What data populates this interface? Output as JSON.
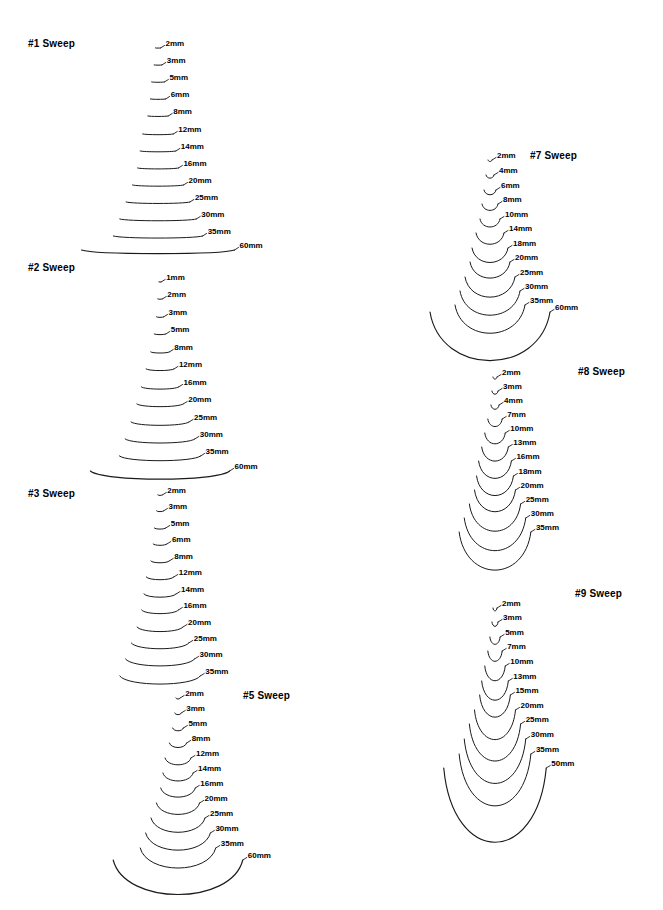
{
  "page": {
    "background": "#ffffff",
    "ink": "#1a1a1a",
    "width": 663,
    "height": 910
  },
  "chart_data": {
    "type": "line",
    "xlabel": "",
    "ylabel": "",
    "grid": false,
    "legend": "none",
    "series": [
      {
        "name": "#1 Sweep",
        "curvature": 0.02,
        "values": [
          2,
          3,
          5,
          6,
          8,
          12,
          14,
          16,
          20,
          25,
          30,
          35,
          60
        ],
        "labels": [
          "2mm",
          "3mm",
          "5mm",
          "6mm",
          "8mm",
          "12mm",
          "14mm",
          "16mm",
          "20mm",
          "25mm",
          "30mm",
          "35mm",
          "60mm"
        ]
      },
      {
        "name": "#2 Sweep",
        "curvature": 0.05,
        "values": [
          1,
          2,
          3,
          5,
          8,
          12,
          16,
          20,
          25,
          30,
          35,
          60
        ],
        "labels": [
          "1mm",
          "2mm",
          "3mm",
          "5mm",
          "8mm",
          "12mm",
          "16mm",
          "20mm",
          "25mm",
          "30mm",
          "35mm",
          "60mm"
        ]
      },
      {
        "name": "#3 Sweep",
        "curvature": 0.09,
        "values": [
          2,
          3,
          5,
          6,
          8,
          12,
          14,
          16,
          20,
          25,
          30,
          35
        ],
        "labels": [
          "2mm",
          "3mm",
          "5mm",
          "6mm",
          "8mm",
          "12mm",
          "14mm",
          "16mm",
          "20mm",
          "25mm",
          "30mm",
          "35mm"
        ]
      },
      {
        "name": "#5 Sweep",
        "curvature": 0.24,
        "values": [
          2,
          3,
          5,
          8,
          12,
          14,
          16,
          20,
          25,
          30,
          35,
          60
        ],
        "labels": [
          "2mm",
          "3mm",
          "5mm",
          "8mm",
          "12mm",
          "14mm",
          "16mm",
          "20mm",
          "25mm",
          "30mm",
          "35mm",
          "60mm"
        ]
      },
      {
        "name": "#7 Sweep",
        "curvature": 0.36,
        "values": [
          2,
          4,
          6,
          8,
          10,
          14,
          18,
          20,
          25,
          30,
          35,
          60
        ],
        "labels": [
          "2mm",
          "4mm",
          "6mm",
          "8mm",
          "10mm",
          "14mm",
          "18mm",
          "20mm",
          "25mm",
          "30mm",
          "35mm",
          "60mm"
        ]
      },
      {
        "name": "#8 Sweep",
        "curvature": 0.46,
        "values": [
          2,
          3,
          4,
          7,
          10,
          13,
          16,
          18,
          20,
          25,
          30,
          35
        ],
        "labels": [
          "2mm",
          "3mm",
          "4mm",
          "7mm",
          "10mm",
          "13mm",
          "16mm",
          "18mm",
          "20mm",
          "25mm",
          "30mm",
          "35mm"
        ]
      },
      {
        "name": "#9 Sweep",
        "curvature": 0.62,
        "values": [
          2,
          3,
          5,
          7,
          10,
          13,
          15,
          20,
          25,
          30,
          35,
          50
        ],
        "labels": [
          "2mm",
          "3mm",
          "5mm",
          "7mm",
          "10mm",
          "13mm",
          "15mm",
          "20mm",
          "25mm",
          "30mm",
          "35mm",
          "50mm"
        ]
      }
    ]
  },
  "groups": [
    {
      "id": "sweep-1",
      "title": "#1 Sweep",
      "title_x": 28,
      "title_y": 38,
      "origin_x": 158,
      "origin_y": 48,
      "scale": 2.55,
      "row_step": 17.0,
      "curvature": 0.022,
      "label_dx": 5,
      "rows": [
        {
          "label": "2mm",
          "w": 2,
          "y": 48
        },
        {
          "label": "3mm",
          "w": 3,
          "y": 65
        },
        {
          "label": "5mm",
          "w": 5,
          "y": 82
        },
        {
          "label": "6mm",
          "w": 6,
          "y": 99
        },
        {
          "label": "8mm",
          "w": 8,
          "y": 116
        },
        {
          "label": "12mm",
          "w": 12,
          "y": 134
        },
        {
          "label": "14mm",
          "w": 14,
          "y": 151
        },
        {
          "label": "16mm",
          "w": 16,
          "y": 168
        },
        {
          "label": "20mm",
          "w": 20,
          "y": 185
        },
        {
          "label": "25mm",
          "w": 25,
          "y": 202
        },
        {
          "label": "30mm",
          "w": 30,
          "y": 219
        },
        {
          "label": "35mm",
          "w": 35,
          "y": 236
        },
        {
          "label": "60mm",
          "w": 60,
          "y": 250
        }
      ]
    },
    {
      "id": "sweep-2",
      "title": "#2 Sweep",
      "title_x": 28,
      "title_y": 262,
      "origin_x": 160,
      "origin_y": 282,
      "scale": 2.32,
      "row_step": 17.0,
      "curvature": 0.055,
      "label_dx": 5,
      "rows": [
        {
          "label": "1mm",
          "w": 1,
          "y": 282
        },
        {
          "label": "2mm",
          "w": 2,
          "y": 299
        },
        {
          "label": "3mm",
          "w": 3,
          "y": 317
        },
        {
          "label": "5mm",
          "w": 5,
          "y": 334
        },
        {
          "label": "8mm",
          "w": 8,
          "y": 352
        },
        {
          "label": "12mm",
          "w": 12,
          "y": 369
        },
        {
          "label": "16mm",
          "w": 16,
          "y": 387
        },
        {
          "label": "20mm",
          "w": 20,
          "y": 404
        },
        {
          "label": "25mm",
          "w": 25,
          "y": 422
        },
        {
          "label": "30mm",
          "w": 30,
          "y": 439
        },
        {
          "label": "35mm",
          "w": 35,
          "y": 456
        },
        {
          "label": "60mm",
          "w": 60,
          "y": 471
        }
      ]
    },
    {
      "id": "sweep-3",
      "title": "#3 Sweep",
      "title_x": 28,
      "title_y": 488,
      "origin_x": 160,
      "origin_y": 495,
      "scale": 2.3,
      "row_step": 16.4,
      "curvature": 0.095,
      "label_dx": 5,
      "rows": [
        {
          "label": "2mm",
          "w": 2,
          "y": 495
        },
        {
          "label": "3mm",
          "w": 3,
          "y": 511
        },
        {
          "label": "5mm",
          "w": 5,
          "y": 528
        },
        {
          "label": "6mm",
          "w": 6,
          "y": 544
        },
        {
          "label": "8mm",
          "w": 8,
          "y": 561
        },
        {
          "label": "12mm",
          "w": 12,
          "y": 577
        },
        {
          "label": "14mm",
          "w": 14,
          "y": 594
        },
        {
          "label": "16mm",
          "w": 16,
          "y": 610
        },
        {
          "label": "20mm",
          "w": 20,
          "y": 627
        },
        {
          "label": "25mm",
          "w": 25,
          "y": 643
        },
        {
          "label": "30mm",
          "w": 30,
          "y": 659
        },
        {
          "label": "35mm",
          "w": 35,
          "y": 676
        }
      ]
    },
    {
      "id": "sweep-5",
      "title": "#5 Sweep",
      "title_x": 243,
      "title_y": 690,
      "origin_x": 178,
      "origin_y": 698,
      "scale": 2.16,
      "row_step": 14.8,
      "curvature": 0.25,
      "label_dx": 5,
      "rows": [
        {
          "label": "2mm",
          "w": 2,
          "y": 698
        },
        {
          "label": "3mm",
          "w": 3,
          "y": 713
        },
        {
          "label": "5mm",
          "w": 5,
          "y": 728
        },
        {
          "label": "8mm",
          "w": 8,
          "y": 743
        },
        {
          "label": "12mm",
          "w": 12,
          "y": 758
        },
        {
          "label": "14mm",
          "w": 14,
          "y": 773
        },
        {
          "label": "16mm",
          "w": 16,
          "y": 788
        },
        {
          "label": "20mm",
          "w": 20,
          "y": 803
        },
        {
          "label": "25mm",
          "w": 25,
          "y": 818
        },
        {
          "label": "30mm",
          "w": 30,
          "y": 833
        },
        {
          "label": "35mm",
          "w": 35,
          "y": 848
        },
        {
          "label": "60mm",
          "w": 60,
          "y": 860
        }
      ]
    },
    {
      "id": "sweep-7",
      "title": "#7 Sweep",
      "title_x": 530,
      "title_y": 150,
      "origin_x": 490,
      "origin_y": 160,
      "scale": 2.0,
      "row_step": 14.6,
      "curvature": 0.38,
      "label_dx": 5,
      "rows": [
        {
          "label": "2mm",
          "w": 2,
          "y": 160
        },
        {
          "label": "4mm",
          "w": 4,
          "y": 175
        },
        {
          "label": "6mm",
          "w": 6,
          "y": 190
        },
        {
          "label": "8mm",
          "w": 8,
          "y": 204
        },
        {
          "label": "10mm",
          "w": 10,
          "y": 219
        },
        {
          "label": "14mm",
          "w": 14,
          "y": 233
        },
        {
          "label": "18mm",
          "w": 18,
          "y": 248
        },
        {
          "label": "20mm",
          "w": 20,
          "y": 262
        },
        {
          "label": "25mm",
          "w": 25,
          "y": 277
        },
        {
          "label": "30mm",
          "w": 30,
          "y": 291
        },
        {
          "label": "35mm",
          "w": 35,
          "y": 305
        },
        {
          "label": "60mm",
          "w": 60,
          "y": 312
        }
      ]
    },
    {
      "id": "sweep-8",
      "title": "#8 Sweep",
      "title_x": 578,
      "title_y": 366,
      "origin_x": 495,
      "origin_y": 377,
      "scale": 2.05,
      "row_step": 14.2,
      "curvature": 0.5,
      "label_dx": 5,
      "rows": [
        {
          "label": "2mm",
          "w": 2,
          "y": 377
        },
        {
          "label": "3mm",
          "w": 3,
          "y": 391
        },
        {
          "label": "4mm",
          "w": 4,
          "y": 405
        },
        {
          "label": "7mm",
          "w": 7,
          "y": 419
        },
        {
          "label": "10mm",
          "w": 10,
          "y": 433
        },
        {
          "label": "13mm",
          "w": 13,
          "y": 447
        },
        {
          "label": "16mm",
          "w": 16,
          "y": 461
        },
        {
          "label": "18mm",
          "w": 18,
          "y": 476
        },
        {
          "label": "20mm",
          "w": 20,
          "y": 490
        },
        {
          "label": "25mm",
          "w": 25,
          "y": 504
        },
        {
          "label": "30mm",
          "w": 30,
          "y": 518
        },
        {
          "label": "35mm",
          "w": 35,
          "y": 532
        }
      ]
    },
    {
      "id": "sweep-9",
      "title": "#9 Sweep",
      "title_x": 575,
      "title_y": 588,
      "origin_x": 495,
      "origin_y": 608,
      "scale": 2.05,
      "row_step": 14.8,
      "curvature": 0.68,
      "label_dx": 5,
      "rows": [
        {
          "label": "2mm",
          "w": 2,
          "y": 608
        },
        {
          "label": "3mm",
          "w": 3,
          "y": 622
        },
        {
          "label": "5mm",
          "w": 5,
          "y": 637
        },
        {
          "label": "7mm",
          "w": 7,
          "y": 651
        },
        {
          "label": "10mm",
          "w": 10,
          "y": 666
        },
        {
          "label": "13mm",
          "w": 13,
          "y": 681
        },
        {
          "label": "15mm",
          "w": 15,
          "y": 695
        },
        {
          "label": "20mm",
          "w": 20,
          "y": 710
        },
        {
          "label": "25mm",
          "w": 25,
          "y": 724
        },
        {
          "label": "30mm",
          "w": 30,
          "y": 739
        },
        {
          "label": "35mm",
          "w": 35,
          "y": 754
        },
        {
          "label": "50mm",
          "w": 50,
          "y": 768
        }
      ]
    }
  ]
}
